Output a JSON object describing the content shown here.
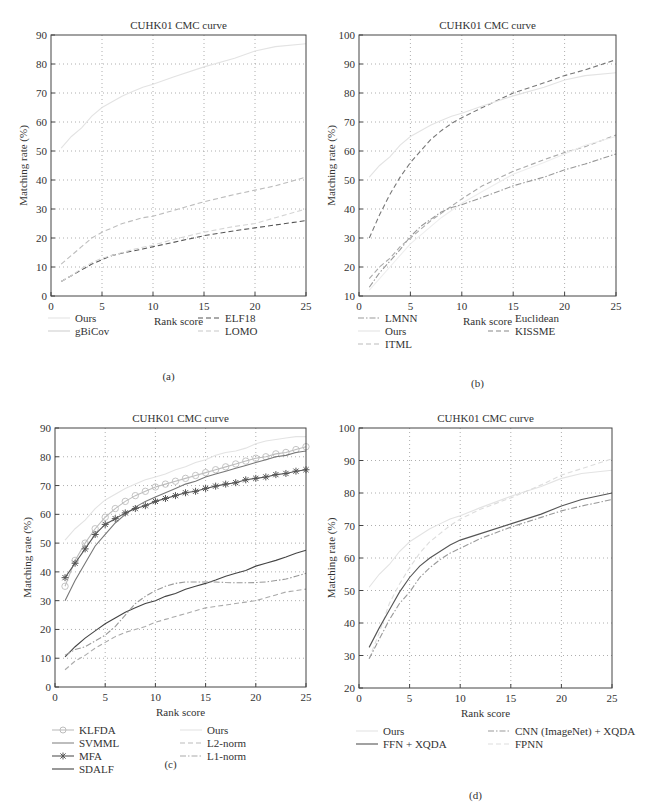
{
  "figure": {
    "panels": [
      "(a)",
      "(b)",
      "(c)",
      "(d)"
    ]
  },
  "chart_data": [
    {
      "id": "a",
      "type": "line",
      "title": "CUHK01 CMC curve",
      "xlabel": "Rank score",
      "ylabel": "Matching rate (%)",
      "caption": "(a)",
      "xlim": [
        0,
        25
      ],
      "ylim": [
        0,
        90
      ],
      "xticks": [
        0,
        5,
        10,
        15,
        20,
        25
      ],
      "yticks": [
        0,
        10,
        20,
        30,
        40,
        50,
        60,
        70,
        80,
        90
      ],
      "grid": true,
      "legend_position": "below",
      "x": [
        1,
        2,
        3,
        4,
        5,
        6,
        7,
        8,
        9,
        10,
        12,
        15,
        18,
        20,
        22,
        25
      ],
      "series": [
        {
          "name": "Ours",
          "style": "solid",
          "color": "#e3e3e3",
          "values": [
            51,
            55,
            58,
            62,
            65,
            67,
            69,
            70.5,
            72,
            73,
            75.5,
            79,
            82,
            84.5,
            86,
            87
          ]
        },
        {
          "name": "gBiCov",
          "style": "dashed",
          "color": "#bdbdbd",
          "values": [
            11,
            14,
            17,
            20,
            22,
            23.5,
            25,
            26,
            27,
            27.5,
            29.5,
            32.5,
            35,
            36.5,
            38,
            41
          ]
        },
        {
          "name": "ELF18",
          "style": "dashed",
          "color": "#555555",
          "values": [
            5,
            7,
            9,
            11,
            12.5,
            14,
            14.8,
            15.5,
            16.2,
            17,
            18.5,
            20.8,
            22.5,
            23.5,
            24.5,
            26
          ]
        },
        {
          "name": "LOMO",
          "style": "dashed",
          "color": "#d5d5d5",
          "values": [
            5,
            7,
            9.5,
            11.5,
            13,
            14,
            15,
            16,
            16.8,
            17.5,
            19.5,
            22,
            24,
            25,
            27,
            30
          ]
        }
      ],
      "legend": [
        {
          "label": "Ours",
          "style": "solid",
          "color": "#e3e3e3"
        },
        {
          "label": "gBiCov",
          "style": "solid",
          "color": "#d0d0d0"
        },
        {
          "label": "ELF18",
          "style": "dashed",
          "color": "#555555"
        },
        {
          "label": "LOMO",
          "style": "dashed",
          "color": "#c8c8c8"
        }
      ]
    },
    {
      "id": "b",
      "type": "line",
      "title": "CUHK01 CMC curve",
      "xlabel": "Rank score",
      "ylabel": "Matching rate (%)",
      "caption": "(b)",
      "xlim": [
        0,
        25
      ],
      "ylim": [
        10,
        100
      ],
      "xticks": [
        0,
        5,
        10,
        15,
        20,
        25
      ],
      "yticks": [
        10,
        20,
        30,
        40,
        50,
        60,
        70,
        80,
        90,
        100
      ],
      "grid": true,
      "legend_position": "below",
      "x": [
        1,
        2,
        3,
        4,
        5,
        6,
        7,
        8,
        9,
        10,
        12,
        15,
        18,
        20,
        22,
        25
      ],
      "series": [
        {
          "name": "LMNN",
          "style": "dashed",
          "color": "#777777",
          "values": [
            30,
            38,
            45,
            51,
            56,
            60,
            64,
            67,
            69.5,
            71.5,
            75,
            80,
            83.5,
            86,
            88,
            91.5
          ]
        },
        {
          "name": "Ours",
          "style": "solid",
          "color": "#e3e3e3",
          "values": [
            51,
            55,
            58,
            62,
            65,
            67,
            69,
            70.5,
            72,
            73,
            75.5,
            79,
            82,
            84.5,
            86,
            87
          ]
        },
        {
          "name": "ITML",
          "style": "dashed",
          "color": "#aaaaaa",
          "values": [
            16,
            20,
            23,
            27,
            30,
            33,
            36,
            38.5,
            41,
            43.5,
            48,
            53,
            57,
            59.5,
            61.5,
            65.5
          ]
        },
        {
          "name": "Euclidean",
          "style": "solid",
          "color": "#eeeeee",
          "values": [
            12,
            16,
            20,
            24,
            28,
            31,
            34,
            37,
            39.5,
            42,
            46,
            52,
            56,
            59,
            62,
            65
          ]
        },
        {
          "name": "KISSME",
          "style": "dashdot",
          "color": "#999999",
          "values": [
            13,
            18,
            22,
            26,
            30.5,
            34,
            36.5,
            39,
            40.5,
            41.5,
            44,
            48,
            51,
            53.5,
            55.5,
            59
          ]
        }
      ],
      "legend": [
        {
          "label": "LMNN",
          "style": "dashdot",
          "color": "#999999"
        },
        {
          "label": "Ours",
          "style": "solid",
          "color": "#e3e3e3"
        },
        {
          "label": "ITML",
          "style": "dashed",
          "color": "#bbbbbb"
        },
        {
          "label": "Euclidean",
          "style": "solid",
          "color": "#ffffff"
        },
        {
          "label": "KISSME",
          "style": "dashed",
          "color": "#888888"
        }
      ]
    },
    {
      "id": "c",
      "type": "line",
      "title": "CUHK01 CMC curve",
      "xlabel": "Rank score",
      "ylabel": "Matching rate (%)",
      "caption": "(c)",
      "xlim": [
        0,
        25
      ],
      "ylim": [
        0,
        90
      ],
      "xticks": [
        0,
        5,
        10,
        15,
        20,
        25
      ],
      "yticks": [
        0,
        10,
        20,
        30,
        40,
        50,
        60,
        70,
        80,
        90
      ],
      "grid": true,
      "legend_position": "below",
      "x": [
        1,
        2,
        3,
        4,
        5,
        6,
        7,
        8,
        9,
        10,
        11,
        12,
        13,
        14,
        15,
        16,
        17,
        18,
        19,
        20,
        21,
        22,
        23,
        24,
        25
      ],
      "series": [
        {
          "name": "KLFDA",
          "style": "solid-marker-circle",
          "color": "#bdbdbd",
          "values": [
            35,
            44,
            50,
            55,
            59,
            62,
            64.5,
            66.5,
            68,
            69.5,
            70.5,
            71.5,
            72.5,
            73.5,
            74.5,
            75.5,
            76.5,
            77.5,
            78.5,
            79.5,
            80,
            81,
            81.5,
            82.5,
            83.5
          ]
        },
        {
          "name": "SVMML",
          "style": "solid",
          "color": "#777777",
          "values": [
            30,
            37,
            43,
            49,
            53,
            57,
            60,
            62.5,
            64.5,
            66,
            67.5,
            69,
            70.5,
            71.5,
            73,
            74,
            75,
            76,
            77,
            78,
            79,
            80,
            80.5,
            81.5,
            82
          ]
        },
        {
          "name": "MFA",
          "style": "solid-marker-star",
          "color": "#555555",
          "values": [
            38,
            43,
            48,
            53,
            56.5,
            58.5,
            60.5,
            62,
            63,
            64.5,
            65.5,
            66.5,
            67.5,
            68,
            69,
            69.8,
            70.5,
            71,
            72,
            72.5,
            73,
            73.8,
            74.2,
            75,
            75.5
          ]
        },
        {
          "name": "SDALF",
          "style": "solid",
          "color": "#444444",
          "values": [
            10.5,
            14,
            17,
            19.5,
            22,
            24,
            26,
            27.5,
            29,
            30,
            31.5,
            32.5,
            34,
            35,
            36,
            37.2,
            38.5,
            39.5,
            40.5,
            42,
            43,
            44,
            45.2,
            46.5,
            47.5
          ]
        },
        {
          "name": "Ours",
          "style": "solid",
          "color": "#e3e3e3",
          "values": [
            51,
            55,
            58,
            62,
            65,
            67,
            69,
            70.5,
            72,
            73,
            74,
            75.5,
            76.5,
            78,
            79,
            80.5,
            81.5,
            82,
            83,
            84.5,
            85.5,
            86,
            86.5,
            87,
            87
          ]
        },
        {
          "name": "L2-norm",
          "style": "dashed",
          "color": "#aaaaaa",
          "values": [
            6,
            9,
            11,
            13.5,
            15.5,
            17.5,
            19,
            20,
            21,
            22.5,
            23.5,
            24.5,
            25.5,
            26.5,
            27.5,
            28,
            28.5,
            29,
            29.5,
            30,
            31,
            32,
            33,
            33.5,
            34
          ]
        },
        {
          "name": "L1-norm",
          "style": "dashdot",
          "color": "#999999",
          "values": [
            11,
            13,
            14,
            16,
            18,
            21,
            25,
            29,
            31.5,
            33.5,
            35,
            36,
            36.5,
            36.5,
            36.5,
            36.5,
            36.3,
            36.2,
            36.2,
            36.3,
            36.5,
            37,
            37.5,
            38.5,
            39.5
          ]
        }
      ],
      "legend": [
        {
          "label": "KLFDA",
          "style": "solid-marker-circle",
          "color": "#bdbdbd"
        },
        {
          "label": "SVMML",
          "style": "solid",
          "color": "#888888"
        },
        {
          "label": "MFA",
          "style": "solid-marker-star",
          "color": "#555555"
        },
        {
          "label": "SDALF",
          "style": "solid",
          "color": "#444444"
        },
        {
          "label": "Ours",
          "style": "solid",
          "color": "#e3e3e3"
        },
        {
          "label": "L2-norm",
          "style": "dashed",
          "color": "#bbbbbb"
        },
        {
          "label": "L1-norm",
          "style": "dashdot",
          "color": "#aaaaaa"
        }
      ]
    },
    {
      "id": "d",
      "type": "line",
      "title": "CUHK01 CMC curve",
      "xlabel": "Rank score",
      "ylabel": "Matching rate (%)",
      "caption": "(d)",
      "xlim": [
        0,
        25
      ],
      "ylim": [
        20,
        100
      ],
      "xticks": [
        0,
        5,
        10,
        15,
        20,
        25
      ],
      "yticks": [
        20,
        30,
        40,
        50,
        60,
        70,
        80,
        90,
        100
      ],
      "grid": true,
      "legend_position": "below",
      "x": [
        1,
        2,
        3,
        4,
        5,
        6,
        7,
        8,
        9,
        10,
        12,
        15,
        18,
        20,
        22,
        25
      ],
      "series": [
        {
          "name": "Ours",
          "style": "solid",
          "color": "#e3e3e3",
          "values": [
            51,
            55,
            58,
            62,
            65,
            67,
            69,
            70.5,
            72,
            73,
            75.5,
            79,
            82,
            84.5,
            86,
            87
          ]
        },
        {
          "name": "FPNN",
          "style": "dashed",
          "color": "#dddddd",
          "values": [
            29,
            37,
            46,
            52,
            57,
            61.5,
            65,
            67.5,
            70,
            72,
            75,
            78.5,
            82.5,
            85.5,
            87.5,
            90.5
          ]
        },
        {
          "name": "FFN + XQDA",
          "style": "solid",
          "color": "#555555",
          "values": [
            32.5,
            38.5,
            44,
            49.5,
            54,
            57.5,
            60,
            62,
            64,
            65.5,
            67.5,
            70.5,
            73.5,
            76,
            78,
            80
          ]
        },
        {
          "name": "CNN (ImageNet) + XQDA",
          "style": "dashdot",
          "color": "#999999",
          "values": [
            29,
            35,
            41,
            46,
            49.5,
            54,
            57,
            59.5,
            61.5,
            63,
            66,
            69.5,
            72.5,
            74.5,
            76,
            78
          ]
        }
      ],
      "legend": [
        {
          "label": "Ours",
          "style": "solid",
          "color": "#e3e3e3"
        },
        {
          "label": "FFN + XQDA",
          "style": "solid",
          "color": "#555555"
        },
        {
          "label": "CNN (ImageNet) + XQDA",
          "style": "dashdot",
          "color": "#999999"
        },
        {
          "label": "FPNN",
          "style": "dashed",
          "color": "#dddddd"
        }
      ]
    }
  ]
}
